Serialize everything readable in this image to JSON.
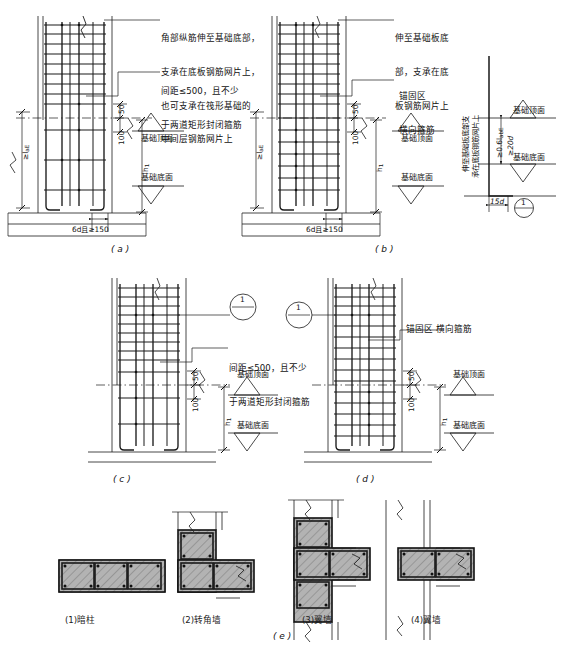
{
  "sheet": {
    "title_domain": "structural-rebar-detail",
    "ink_color": "#1a1a1a",
    "concrete_fill": "#a8a8a8",
    "hatch_color": "#9a9a9a"
  },
  "panels": [
    {
      "id": "a",
      "label": "( a )",
      "notes": [
        {
          "name": "corner-bar-note",
          "lines": [
            "角部纵筋伸至基础底部，",
            "支承在底板钢筋网片上，",
            "也可支承在筏形基础的",
            "中间层钢筋网片上"
          ]
        },
        {
          "name": "stirrup-spacing-note",
          "lines": [
            "间距≤500，且不少",
            "于两道矩形封闭箍筋"
          ]
        }
      ],
      "dims": [
        {
          "name": "anchor-length",
          "text": "≥l",
          "sub": "aE",
          "orient": "vertical"
        },
        {
          "name": "cover-50",
          "text": "50",
          "orient": "vertical"
        },
        {
          "name": "cover-100",
          "text": "100",
          "orient": "vertical"
        },
        {
          "name": "foundation-depth",
          "text": "h",
          "sub": "1",
          "orient": "vertical"
        },
        {
          "name": "bend-length",
          "text": "6d且≥150",
          "orient": "horizontal"
        }
      ],
      "levels": [
        {
          "name": "foundation-top-level",
          "text": "基础顶面"
        },
        {
          "name": "foundation-bottom-level",
          "text": "基础底面"
        }
      ]
    },
    {
      "id": "b",
      "label": "( b )",
      "notes": [
        {
          "name": "extend-to-slab-bottom-note",
          "lines": [
            "伸至基础板底",
            "部，支承在底",
            "板钢筋网片上"
          ]
        },
        {
          "name": "anchorage-zone-note",
          "lines": [
            "锚固区",
            "横向箍筋"
          ]
        },
        {
          "name": "detail-vertical-note",
          "lines": [
            "伸至基础板底部支",
            "承在底板钢筋网片上"
          ]
        }
      ],
      "dims": [
        {
          "name": "anchor-length",
          "text": "≥l",
          "sub": "aE",
          "orient": "vertical"
        },
        {
          "name": "cover-50",
          "text": "50",
          "orient": "vertical"
        },
        {
          "name": "cover-100",
          "text": "100",
          "orient": "vertical"
        },
        {
          "name": "foundation-depth",
          "text": "h",
          "sub": "1",
          "orient": "vertical"
        },
        {
          "name": "bend-length",
          "text": "6d且≥150",
          "orient": "horizontal"
        },
        {
          "name": "hook-15d",
          "text": "15d",
          "orient": "horizontal"
        },
        {
          "name": "min-0-6-lab",
          "text": "≥0.6l",
          "sub": "abE",
          "orient": "vertical"
        },
        {
          "name": "min-20d",
          "text": "≥20d",
          "orient": "vertical"
        }
      ],
      "levels": [
        {
          "name": "foundation-top-level",
          "text": "基础顶面"
        },
        {
          "name": "foundation-bottom-level",
          "text": "基础底面"
        }
      ],
      "callout": {
        "name": "detail-callout-1",
        "number": "1",
        "divider": "—"
      }
    },
    {
      "id": "c",
      "label": "( c )",
      "notes": [
        {
          "name": "stirrup-spacing-note",
          "lines": [
            "间距≤500，且不少",
            "于两道矩形封闭箍筋"
          ]
        }
      ],
      "dims": [
        {
          "name": "cover-50",
          "text": "50",
          "orient": "vertical"
        },
        {
          "name": "cover-100",
          "text": "100",
          "orient": "vertical"
        },
        {
          "name": "foundation-depth",
          "text": "h",
          "sub": "1",
          "orient": "vertical"
        }
      ],
      "levels": [
        {
          "name": "foundation-top-level",
          "text": "基础顶面"
        },
        {
          "name": "foundation-bottom-level",
          "text": "基础底面"
        }
      ],
      "callout": {
        "name": "section-callout-1",
        "number": "1",
        "divider": "—"
      }
    },
    {
      "id": "d",
      "label": "( d )",
      "notes": [
        {
          "name": "anchorage-zone-note",
          "lines": [
            "锚固区 横向箍筋"
          ]
        }
      ],
      "dims": [
        {
          "name": "cover-50",
          "text": "50",
          "orient": "vertical"
        },
        {
          "name": "cover-100",
          "text": "100",
          "orient": "vertical"
        },
        {
          "name": "foundation-depth",
          "text": "h",
          "sub": "1",
          "orient": "vertical"
        }
      ],
      "levels": [
        {
          "name": "foundation-top-level",
          "text": "基础顶面"
        },
        {
          "name": "foundation-bottom-level",
          "text": "基础底面"
        }
      ],
      "callout": {
        "name": "section-callout-1",
        "number": "1",
        "divider": "—"
      }
    }
  ],
  "sections": {
    "label": "( e )",
    "items": [
      {
        "name": "section-concealed-column",
        "caption": "(1)暗柱"
      },
      {
        "name": "section-corner-wall",
        "caption": "(2)转角墙"
      },
      {
        "name": "section-flange-wall-t",
        "caption": "(3)翼墙"
      },
      {
        "name": "section-flange-wall-cross",
        "caption": "(4)翼墙"
      }
    ]
  }
}
